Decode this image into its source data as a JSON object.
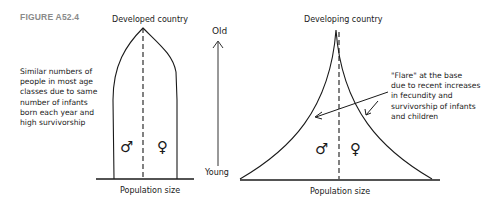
{
  "figure": {
    "label": "FIGURE A52.4"
  },
  "developed": {
    "title": "Developed country",
    "annotation": [
      "Similar numbers of",
      "people in most age",
      "classes due to same",
      "number of infants",
      "born each year and",
      "high survivorship"
    ],
    "male_symbol": "♂",
    "female_symbol": "♀",
    "xlabel": "Population size"
  },
  "age_axis": {
    "top_label": "Old",
    "bottom_label": "Young"
  },
  "developing": {
    "title": "Developing country",
    "annotation": [
      "\"Flare\" at the base",
      "due to recent increases",
      "in fecundity and",
      "survivorship of infants",
      "and children"
    ],
    "male_symbol": "♂",
    "female_symbol": "♀",
    "xlabel": "Population size"
  },
  "colors": {
    "line": "#1a1a1a",
    "figure_label": "#8a8a8a",
    "axis": "#333333"
  }
}
